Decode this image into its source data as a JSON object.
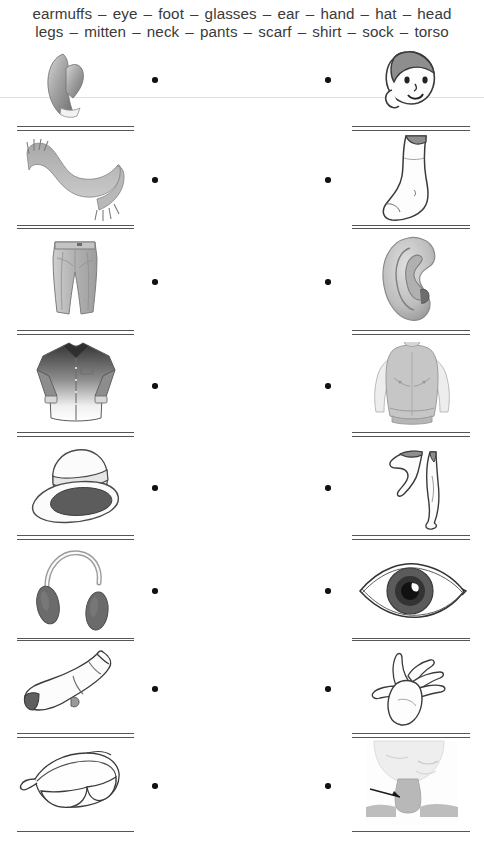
{
  "worksheet": {
    "word_bank": {
      "separator": "–",
      "line1": [
        "earmuffs",
        "eye",
        "foot",
        "glasses",
        "ear",
        "hand",
        "hat",
        "head"
      ],
      "line2": [
        "legs",
        "mitten",
        "neck",
        "pants",
        "scarf",
        "shirt",
        "sock",
        "torso"
      ]
    },
    "rows": [
      {
        "left": {
          "picture": "mitten",
          "answer": ""
        },
        "right": {
          "picture": "head",
          "answer": ""
        }
      },
      {
        "left": {
          "picture": "scarf",
          "answer": ""
        },
        "right": {
          "picture": "foot",
          "answer": ""
        }
      },
      {
        "left": {
          "picture": "pants",
          "answer": ""
        },
        "right": {
          "picture": "ear",
          "answer": ""
        }
      },
      {
        "left": {
          "picture": "shirt",
          "answer": ""
        },
        "right": {
          "picture": "torso",
          "answer": ""
        }
      },
      {
        "left": {
          "picture": "hat",
          "answer": ""
        },
        "right": {
          "picture": "legs",
          "answer": ""
        }
      },
      {
        "left": {
          "picture": "earmuffs",
          "answer": ""
        },
        "right": {
          "picture": "eye",
          "answer": ""
        }
      },
      {
        "left": {
          "picture": "sock",
          "answer": ""
        },
        "right": {
          "picture": "hand",
          "answer": ""
        }
      },
      {
        "left": {
          "picture": "glasses",
          "answer": ""
        },
        "right": {
          "picture": "neck",
          "answer": ""
        }
      }
    ],
    "colors": {
      "ink": "#2b2b2b",
      "line": "#555555",
      "dot": "#111111",
      "art_gray": "#8c8c8c",
      "art_dark": "#4a4a4a"
    }
  }
}
